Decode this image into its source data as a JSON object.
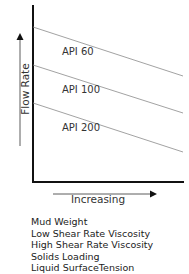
{
  "diagram": {
    "y_axis_label": "Flow Rate",
    "x_axis_label": "Increasing",
    "lines": [
      {
        "label": "API 60",
        "x1": 33,
        "y1": 27,
        "x2": 183,
        "y2": 76,
        "label_x": 62,
        "label_y": 46
      },
      {
        "label": "API 100",
        "x1": 33,
        "y1": 65,
        "x2": 183,
        "y2": 113,
        "label_x": 62,
        "label_y": 84
      },
      {
        "label": "API 200",
        "x1": 33,
        "y1": 103,
        "x2": 183,
        "y2": 152,
        "label_x": 62,
        "label_y": 122
      }
    ],
    "x_variables": [
      "Mud Weight",
      "Low Shear Rate Viscosity",
      "High Shear Rate Viscosity",
      "Solids Loading",
      "Liquid SurfaceTension"
    ],
    "colors": {
      "axis": "#111111",
      "line": "#8a8a8a",
      "arrow": "#222222"
    }
  }
}
